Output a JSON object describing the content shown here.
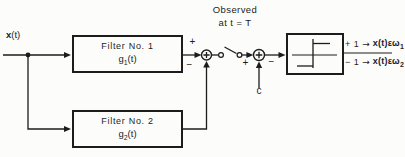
{
  "colors": {
    "ink": "#1c1c1c",
    "background": "#fcfcfb"
  },
  "diagram": {
    "input_signal": {
      "bold": "x",
      "rest": "(t)"
    },
    "observed_note": {
      "line1": "Observed",
      "line2": "at  t = T"
    },
    "filter1": {
      "title": "Filter No. 1",
      "gain_base": "g",
      "gain_sub": "1",
      "gain_arg": "(t)"
    },
    "filter2": {
      "title": "Filter No. 2",
      "gain_base": "g",
      "gain_sub": "2",
      "gain_arg": "(t)"
    },
    "sum1": {
      "top_sign": "+",
      "bottom_sign": "−"
    },
    "sum2": {
      "left_sign": "+",
      "right_sign": "−"
    },
    "threshold_constant": "c",
    "icons": {
      "sum_junction": "⊕",
      "switch": "sampling-switch",
      "limiter": "signum-hard-limiter"
    },
    "decisions": [
      {
        "level": "+ 1",
        "arrow": "→",
        "signal_bold": "x",
        "signal_rest": "(t)",
        "membership": "ε",
        "class_base": "ω",
        "class_sub": "1"
      },
      {
        "level": "− 1",
        "arrow": "→",
        "signal_bold": "x",
        "signal_rest": "(t)",
        "membership": "ε",
        "class_base": "ω",
        "class_sub": "2"
      }
    ]
  }
}
